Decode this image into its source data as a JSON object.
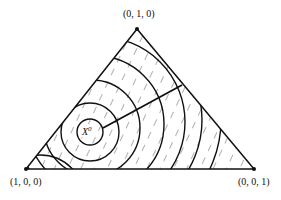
{
  "diagram": {
    "type": "ternary-simplex-contour",
    "vertices": {
      "top": {
        "label": "(0, 1, 0)"
      },
      "left": {
        "label": "(1, 0, 0)"
      },
      "right": {
        "label": "(0, 0, 1)"
      }
    },
    "center_point": {
      "label": "X",
      "superscript": "0"
    },
    "contour_count": 8,
    "hatching": "dashed diagonal lines",
    "colors": {
      "ink": "#111111",
      "background": "#ffffff"
    }
  }
}
